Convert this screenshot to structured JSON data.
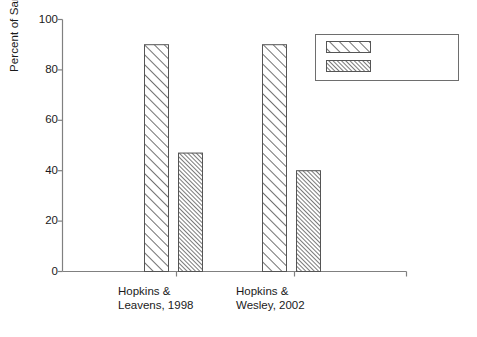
{
  "chart_data": {
    "type": "bar",
    "title": "",
    "subtitle": "",
    "xlabel": "",
    "ylabel": "Percent of Sample",
    "ylim": [
      0,
      100
    ],
    "yticks": [
      0,
      20,
      40,
      60,
      80,
      100
    ],
    "ytick_labels": [
      "0",
      "20",
      "40",
      "60",
      "80",
      "100"
    ],
    "grid": false,
    "legend_position": "top-right",
    "categories": [
      "Hopkins &\nLeavens, 1998",
      "Hopkins &\nWesley, 2002"
    ],
    "series": [
      {
        "name": "Food Beg",
        "values": [
          90,
          90
        ],
        "pattern": "wide-diagonal-hatch"
      },
      {
        "name": "Whole Hand",
        "values": [
          47,
          40
        ],
        "pattern": "dense-diagonal-hatch"
      }
    ]
  },
  "legend": {
    "entries": [
      {
        "label": "Food Beg",
        "swatch": "wide-diagonal-hatch-swatch"
      },
      {
        "label": "Whole Hand",
        "swatch": "dense-diagonal-hatch-swatch"
      }
    ]
  },
  "axes": {
    "y_title": "Percent of Sample",
    "y_tick_labels": [
      "100",
      "80",
      "60",
      "40",
      "20",
      "0"
    ],
    "x_tick_labels": [
      "Hopkins &\nLeavens, 1998",
      "Hopkins &\nWesley, 2002"
    ]
  },
  "colors": {
    "axis": "#808080",
    "bar_outline": "#555555",
    "hatch": "#4d4d4d",
    "text": "#1a1a1a",
    "background": "#ffffff",
    "legend_border": "#6e6e6e"
  }
}
